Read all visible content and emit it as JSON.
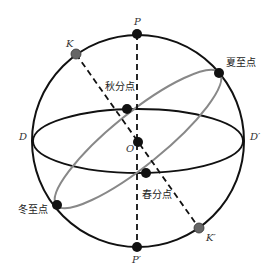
{
  "figure": {
    "type": "celestial-sphere",
    "colors": {
      "background": "#ffffff",
      "sphere_outline": "#111111",
      "equator": "#111111",
      "ecliptic": "#888888",
      "axis_dashed": "#111111",
      "point_black": "#111111",
      "point_gray": "#666666",
      "label": "#333333"
    },
    "labels": {
      "P": "P",
      "P_prime": "P′",
      "K": "K",
      "K_prime": "K′",
      "D": "D",
      "D_prime": "D′",
      "O": "O",
      "autumnal_equinox": "秋分点",
      "vernal_equinox": "春分点",
      "summer_solstice": "夏至点",
      "winter_solstice": "冬至点"
    },
    "geometry": {
      "sphere": {
        "cx": 138,
        "cy": 141,
        "r": 106
      },
      "equator": {
        "cx": 138,
        "cy": 141,
        "rx": 105,
        "ry": 32
      },
      "ecliptic": {
        "cx": 138,
        "cy": 139,
        "rx": 105,
        "ry": 26,
        "rotation_deg": -39
      },
      "points": {
        "P": [
          137,
          34
        ],
        "P_prime": [
          137,
          247
        ],
        "K": [
          76,
          54
        ],
        "K_prime": [
          199,
          228
        ],
        "O": [
          138,
          142
        ],
        "autumnal_equinox": [
          127,
          109
        ],
        "vernal_equinox": [
          146,
          173
        ],
        "summer_solstice": [
          219,
          73
        ],
        "winter_solstice": [
          57,
          205
        ]
      }
    }
  }
}
